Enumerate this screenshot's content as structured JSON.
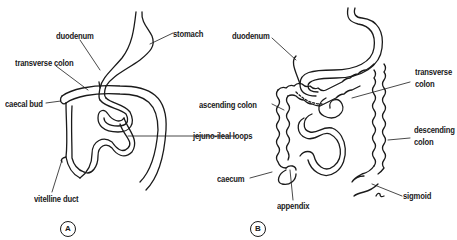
{
  "figure": {
    "panels": [
      {
        "id": "A",
        "marker": "A",
        "labels": {
          "duodenum": "duodenum",
          "stomach": "stomach",
          "transverse_colon": "transverse colon",
          "caecal_bud": "caecal bud",
          "jejuno_ileal_loops": "jejuno-ileal loops",
          "vitelline_duct": "vitelline duct"
        }
      },
      {
        "id": "B",
        "marker": "B",
        "labels": {
          "duodenum": "duodenum",
          "transverse_colon_1": "transverse",
          "transverse_colon_2": "colon",
          "ascending_colon": "ascending colon",
          "descending_colon_1": "descending",
          "descending_colon_2": "colon",
          "caecum": "caecum",
          "appendix": "appendix",
          "sigmoid": "sigmoid"
        }
      }
    ],
    "colors": {
      "line": "#1a1a1a",
      "background": "#ffffff"
    }
  }
}
